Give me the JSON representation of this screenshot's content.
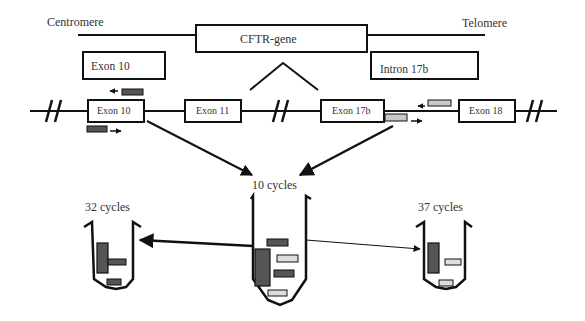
{
  "diagram": {
    "chromosome": {
      "left_label": "Centromere",
      "right_label": "Telomere",
      "gene_label": "CFTR-gene"
    },
    "zoom_boxes": {
      "left": "Exon 10",
      "right": "Intron 17b"
    },
    "gene_segments": {
      "exon10": "Exon 10",
      "exon11": "Exon 11",
      "exon17b": "Exon 17b",
      "exon18": "Exon 18"
    },
    "pcr": {
      "first_round": "10 cycles",
      "left_round": "32 cycles",
      "right_round": "37 cycles"
    },
    "colors": {
      "line": "#111111",
      "primer_dark": "#555555",
      "primer_light": "#c8c8c8",
      "background": "#ffffff"
    }
  }
}
